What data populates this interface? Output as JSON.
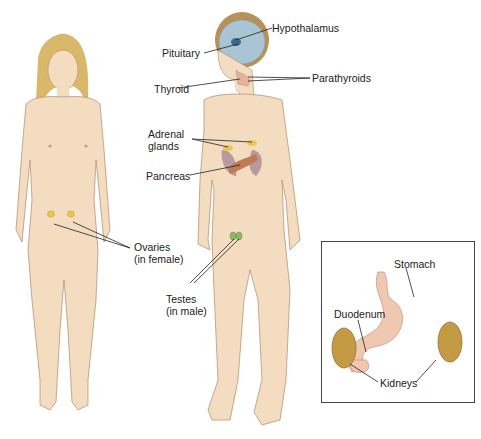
{
  "colors": {
    "skin": "#f3dcc0",
    "skin_shade": "#e3bf98",
    "outline": "#b08a68",
    "hair_female": "#d9b86a",
    "hair_male": "#b8905a",
    "brain": "#a9c4d2",
    "gland_yellow": "#e8c84a",
    "pancreas": "#c07a55",
    "kidney": "#c59a45",
    "testes": "#8fb86a",
    "stomach": "#f0c8b0",
    "leader": "#222222"
  },
  "labels": {
    "hypothalamus": "Hypothalamus",
    "pituitary": "Pituitary",
    "thyroid": "Thyroid",
    "parathyroids": "Parathyroids",
    "adrenal_1": "Adrenal",
    "adrenal_2": "glands",
    "pancreas": "Pancreas",
    "ovaries_1": "Ovaries",
    "ovaries_2": "(in female)",
    "testes_1": "Testes",
    "testes_2": "(in male)"
  },
  "inset": {
    "stomach": "Stomach",
    "duodenum": "Duodenum",
    "kidneys": "Kidneys"
  },
  "figures": [
    "female",
    "male"
  ]
}
